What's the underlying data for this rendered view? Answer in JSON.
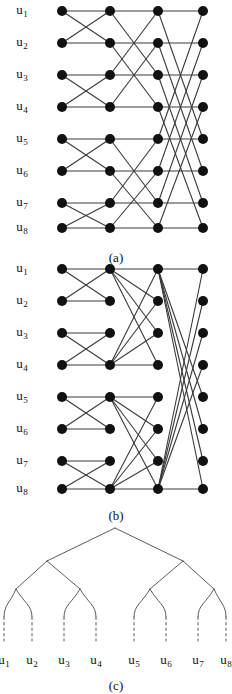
{
  "figure": {
    "width": 231,
    "height": 691,
    "background": "#ffffff",
    "ink": "#1a1a1a",
    "node_color": "#111111",
    "node_radius": 5.0,
    "edge_color": "#3a3a3a",
    "edge_width": 1.1,
    "tree_edge_color": "#4a4a4a",
    "tree_edge_width": 0.9
  },
  "panels": [
    {
      "id": "a",
      "caption": "(a)",
      "caption_x": 116,
      "caption_y": 250,
      "type": "multistage-interconnection-network",
      "columns_x": [
        62,
        110,
        158,
        203
      ],
      "rows_y": [
        11,
        43,
        75,
        107,
        139,
        171,
        203,
        228
      ],
      "row_labels": [
        "u1",
        "u2",
        "u3",
        "u4",
        "u5",
        "u6",
        "u7",
        "u8"
      ],
      "label_x": 22,
      "stages": [
        {
          "name": "stage-1",
          "from_col": 0,
          "to_col": 1,
          "distance": 1,
          "edges": [
            [
              0,
              0
            ],
            [
              0,
              1
            ],
            [
              1,
              0
            ],
            [
              1,
              1
            ],
            [
              2,
              2
            ],
            [
              2,
              3
            ],
            [
              3,
              2
            ],
            [
              3,
              3
            ],
            [
              4,
              4
            ],
            [
              4,
              5
            ],
            [
              5,
              4
            ],
            [
              5,
              5
            ],
            [
              6,
              6
            ],
            [
              6,
              7
            ],
            [
              7,
              6
            ],
            [
              7,
              7
            ]
          ]
        },
        {
          "name": "stage-2",
          "from_col": 1,
          "to_col": 2,
          "distance": 2,
          "edges": [
            [
              0,
              0
            ],
            [
              0,
              2
            ],
            [
              1,
              1
            ],
            [
              1,
              3
            ],
            [
              2,
              0
            ],
            [
              2,
              2
            ],
            [
              3,
              1
            ],
            [
              3,
              3
            ],
            [
              4,
              4
            ],
            [
              4,
              6
            ],
            [
              5,
              5
            ],
            [
              5,
              7
            ],
            [
              6,
              4
            ],
            [
              6,
              6
            ],
            [
              7,
              5
            ],
            [
              7,
              7
            ]
          ]
        },
        {
          "name": "stage-3",
          "from_col": 2,
          "to_col": 3,
          "distance": 4,
          "edges": [
            [
              0,
              0
            ],
            [
              0,
              4
            ],
            [
              1,
              1
            ],
            [
              1,
              5
            ],
            [
              2,
              2
            ],
            [
              2,
              6
            ],
            [
              3,
              3
            ],
            [
              3,
              7
            ],
            [
              4,
              0
            ],
            [
              4,
              4
            ],
            [
              5,
              1
            ],
            [
              5,
              5
            ],
            [
              6,
              2
            ],
            [
              6,
              6
            ],
            [
              7,
              3
            ],
            [
              7,
              7
            ]
          ]
        }
      ]
    },
    {
      "id": "b",
      "caption": "(b)",
      "caption_x": 116,
      "caption_y": 508,
      "type": "multistage-interconnection-network-congested",
      "columns_x": [
        62,
        110,
        158,
        203
      ],
      "rows_y": [
        269,
        301,
        333,
        365,
        397,
        429,
        461,
        489
      ],
      "row_labels": [
        "u1",
        "u2",
        "u3",
        "u4",
        "u5",
        "u6",
        "u7",
        "u8"
      ],
      "label_x": 22,
      "stages": [
        {
          "name": "stage-1",
          "from_col": 0,
          "to_col": 1,
          "distance": 1,
          "edges": [
            [
              0,
              0
            ],
            [
              0,
              1
            ],
            [
              1,
              0
            ],
            [
              1,
              1
            ],
            [
              2,
              2
            ],
            [
              2,
              3
            ],
            [
              3,
              2
            ],
            [
              3,
              3
            ],
            [
              4,
              4
            ],
            [
              4,
              5
            ],
            [
              5,
              4
            ],
            [
              5,
              5
            ],
            [
              6,
              6
            ],
            [
              6,
              7
            ],
            [
              7,
              6
            ],
            [
              7,
              7
            ]
          ]
        },
        {
          "name": "stage-2",
          "from_col": 1,
          "to_col": 2,
          "hubs": [
            0,
            3,
            4,
            7
          ],
          "edges": [
            [
              0,
              0
            ],
            [
              0,
              1
            ],
            [
              0,
              2
            ],
            [
              0,
              3
            ],
            [
              3,
              0
            ],
            [
              3,
              1
            ],
            [
              3,
              2
            ],
            [
              3,
              3
            ],
            [
              4,
              4
            ],
            [
              4,
              5
            ],
            [
              4,
              6
            ],
            [
              4,
              7
            ],
            [
              7,
              4
            ],
            [
              7,
              5
            ],
            [
              7,
              6
            ],
            [
              7,
              7
            ]
          ]
        },
        {
          "name": "stage-3",
          "from_col": 2,
          "to_col": 3,
          "hubs": [
            0,
            7
          ],
          "edges": [
            [
              0,
              4
            ],
            [
              0,
              5
            ],
            [
              0,
              6
            ],
            [
              0,
              7
            ],
            [
              7,
              0
            ],
            [
              7,
              1
            ],
            [
              7,
              2
            ],
            [
              7,
              3
            ],
            [
              0,
              0
            ],
            [
              7,
              7
            ]
          ]
        }
      ]
    },
    {
      "id": "c",
      "caption": "(c)",
      "caption_x": 116,
      "caption_y": 678,
      "type": "binary-tree",
      "root": {
        "x": 115,
        "y": 528
      },
      "level2_y": 561,
      "level3_y": 589,
      "leaf_top_y": 617,
      "leaf_dash_bottom_y": 641,
      "level2_x": [
        47,
        183
      ],
      "level3_x": [
        16,
        80,
        150,
        214
      ],
      "leaf_x": [
        4,
        32,
        64,
        96,
        134,
        166,
        198,
        226
      ],
      "leaf_labels": [
        "u1",
        "u2",
        "u3",
        "u4",
        "u5",
        "u6",
        "u7",
        "u8"
      ],
      "leaf_label_y": 652,
      "dashed_leaf_stubs": true
    }
  ]
}
